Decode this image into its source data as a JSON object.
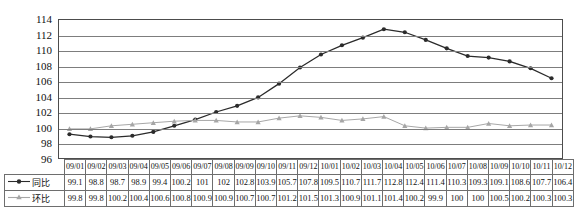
{
  "chart_data": {
    "type": "line",
    "title": "",
    "xlabel": "",
    "ylabel": "",
    "ylim": [
      96,
      114
    ],
    "ytick_step": 2,
    "grid": true,
    "legend_position": "table-left",
    "categories": [
      "09/01",
      "09/02",
      "09/03",
      "09/04",
      "09/05",
      "09/06",
      "09/07",
      "09/08",
      "09/09",
      "09/10",
      "09/11",
      "09/12",
      "10/01",
      "10/02",
      "10/03",
      "10/04",
      "10/05",
      "10/06",
      "10/07",
      "10/08",
      "10/09",
      "10/10",
      "10/11",
      "10/12"
    ],
    "yticks": [
      96,
      98,
      100,
      102,
      104,
      106,
      108,
      110,
      112,
      114
    ],
    "series": [
      {
        "name": "同比",
        "color": "#2b2b2b",
        "marker": "diamond",
        "values": [
          99.1,
          98.8,
          98.7,
          98.9,
          99.4,
          100.2,
          101,
          102,
          102.8,
          103.9,
          105.7,
          107.8,
          109.5,
          110.7,
          111.7,
          112.8,
          112.4,
          111.4,
          110.3,
          109.3,
          109.1,
          108.6,
          107.7,
          106.4
        ]
      },
      {
        "name": "环比",
        "color": "#a6a6a6",
        "marker": "triangle",
        "values": [
          99.8,
          99.8,
          100.2,
          100.4,
          100.6,
          100.8,
          100.9,
          100.9,
          100.7,
          100.7,
          101.2,
          101.5,
          101.3,
          100.9,
          101.1,
          101.4,
          100.2,
          99.9,
          100,
          100,
          100.5,
          100.2,
          100.3,
          100.3
        ]
      }
    ]
  },
  "table": {
    "row_header_blank": ""
  }
}
